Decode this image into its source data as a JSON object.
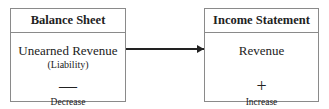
{
  "left_box": {
    "header": "Balance Sheet",
    "title": "Unearned Revenue",
    "subtitle": "(Liability)",
    "sign": "—",
    "caption": "Decrease"
  },
  "right_box": {
    "header": "Income Statement",
    "title": "Revenue",
    "sign": "+",
    "caption": "Increase"
  },
  "arrow": {
    "from": "left_box",
    "to": "right_box",
    "icon": "arrow-right-icon"
  }
}
